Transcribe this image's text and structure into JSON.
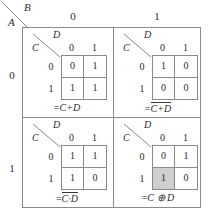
{
  "diagram": {
    "outer": {
      "corner_top_label": "B",
      "corner_bottom_label": "A",
      "column_headers": [
        "0",
        "1"
      ],
      "row_headers": [
        "0",
        "1"
      ]
    },
    "sub_corner": {
      "top_label": "D",
      "bottom_label": "C"
    },
    "sub_headers": {
      "columns": [
        "0",
        "1"
      ],
      "rows": [
        "0",
        "1"
      ]
    },
    "quadrants": [
      {
        "name": "quadrant-A0-B0",
        "a": "0",
        "b": "0",
        "cells": [
          {
            "c": "0",
            "d": "0",
            "value": "0",
            "highlight": false
          },
          {
            "c": "0",
            "d": "1",
            "value": "1",
            "highlight": false
          },
          {
            "c": "1",
            "d": "0",
            "value": "1",
            "highlight": false
          },
          {
            "c": "1",
            "d": "1",
            "value": "1",
            "highlight": false
          }
        ],
        "formula": {
          "prefix": "=",
          "overline": false,
          "body": "C+D",
          "plain": "=C+D"
        }
      },
      {
        "name": "quadrant-A0-B1",
        "a": "0",
        "b": "1",
        "cells": [
          {
            "c": "0",
            "d": "0",
            "value": "1",
            "highlight": false
          },
          {
            "c": "0",
            "d": "1",
            "value": "0",
            "highlight": false
          },
          {
            "c": "1",
            "d": "0",
            "value": "0",
            "highlight": false
          },
          {
            "c": "1",
            "d": "1",
            "value": "0",
            "highlight": false
          }
        ],
        "formula": {
          "prefix": "=",
          "overline": true,
          "body": "C+D",
          "plain": "=NOT(C+D)"
        }
      },
      {
        "name": "quadrant-A1-B0",
        "a": "1",
        "b": "0",
        "cells": [
          {
            "c": "0",
            "d": "0",
            "value": "1",
            "highlight": false
          },
          {
            "c": "0",
            "d": "1",
            "value": "1",
            "highlight": false
          },
          {
            "c": "1",
            "d": "0",
            "value": "1",
            "highlight": false
          },
          {
            "c": "1",
            "d": "1",
            "value": "0",
            "highlight": false
          }
        ],
        "formula": {
          "prefix": "=",
          "overline": true,
          "body": "C·D",
          "plain": "=NOT(C·D)"
        }
      },
      {
        "name": "quadrant-A1-B1",
        "a": "1",
        "b": "1",
        "cells": [
          {
            "c": "0",
            "d": "0",
            "value": "0",
            "highlight": false
          },
          {
            "c": "0",
            "d": "1",
            "value": "1",
            "highlight": false
          },
          {
            "c": "1",
            "d": "0",
            "value": "1",
            "highlight": true
          },
          {
            "c": "1",
            "d": "1",
            "value": "0",
            "highlight": false
          }
        ],
        "formula": {
          "prefix": "=",
          "overline": false,
          "body": "C ⊕ D",
          "plain": "=C ⊕ D"
        }
      }
    ],
    "colors": {
      "line": "#8a8a8a",
      "text": "#2b2b2b",
      "highlight": "#cfcfcf",
      "background": "#ffffff"
    }
  }
}
